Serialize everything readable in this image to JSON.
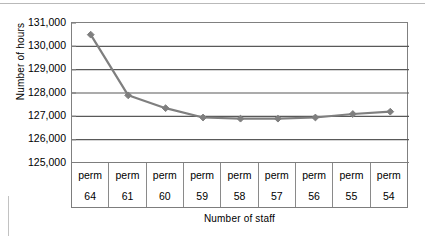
{
  "chart_data": {
    "type": "line",
    "title": "",
    "subtitle": "",
    "xlabel": "Number of staff",
    "ylabel": "Number of hours",
    "categories": [
      "perm 64",
      "perm 61",
      "perm 60",
      "perm 59",
      "perm 58",
      "perm 57",
      "perm 56",
      "perm 55",
      "perm 54"
    ],
    "category_top_labels": [
      "perm",
      "perm",
      "perm",
      "perm",
      "perm",
      "perm",
      "perm",
      "perm",
      "perm"
    ],
    "category_bottom_labels": [
      "64",
      "61",
      "60",
      "59",
      "58",
      "57",
      "56",
      "55",
      "54"
    ],
    "series": [
      {
        "name": "Number of hours",
        "values": [
          130500,
          127900,
          127350,
          126950,
          126900,
          126900,
          126950,
          127100,
          127200
        ],
        "color": "#7f7f7f",
        "marker": "diamond"
      }
    ],
    "ylim": [
      125000,
      131000
    ],
    "yticks": [
      125000,
      126000,
      127000,
      128000,
      129000,
      130000,
      131000
    ],
    "ytick_labels": [
      "125,000",
      "126,000",
      "127,000",
      "128,000",
      "129,000",
      "130,000",
      "131,000"
    ],
    "grid": true,
    "grid_axis": "y",
    "legend": false,
    "legend_position": "none"
  },
  "axes": {
    "y_title": "Number of hours",
    "x_title": "Number of staff"
  },
  "colors": {
    "series_line": "#7f7f7f",
    "gridline": "#595959",
    "frame": "#808080",
    "table_border": "#7d7d7d",
    "text": "#000000",
    "background": "#ffffff"
  }
}
